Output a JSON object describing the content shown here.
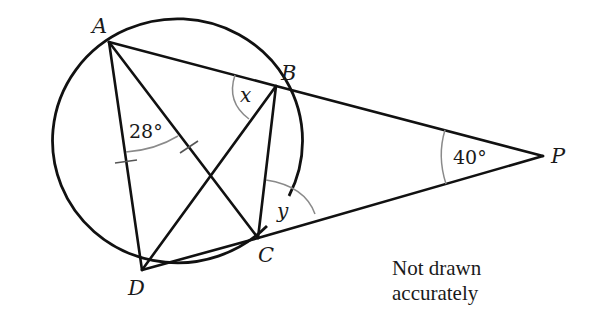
{
  "figure": {
    "points": {
      "A": {
        "label": "A",
        "x": 109,
        "y": 42
      },
      "B": {
        "label": "B",
        "x": 276,
        "y": 86
      },
      "C": {
        "label": "C",
        "x": 258,
        "y": 238
      },
      "D": {
        "label": "D",
        "x": 142,
        "y": 270
      },
      "P": {
        "label": "P",
        "x": 543,
        "y": 156
      }
    },
    "angles": {
      "DAC": "28°",
      "ABD": "x",
      "BPC": "40°",
      "BCP": "y"
    },
    "note": {
      "line1": "Not drawn",
      "line2": "accurately"
    }
  }
}
